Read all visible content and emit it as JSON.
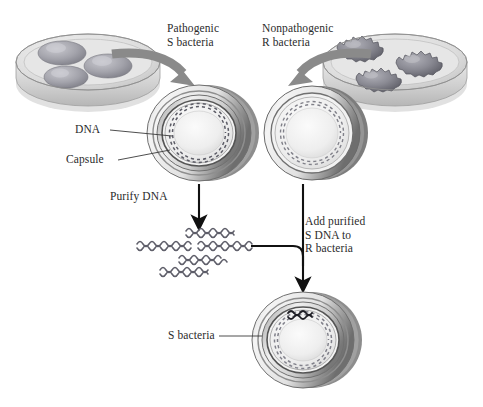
{
  "figure": {
    "background_color": "#ffffff",
    "text_color": "#2b2b2b",
    "arrow_gray": "#8a8a8a",
    "arrow_black": "#111111",
    "dna_color": "#6f6f78"
  },
  "labels": {
    "pathogenic_s": "Pathogenic\nS bacteria",
    "nonpathogenic_r": "Nonpathogenic\nR bacteria",
    "dna": "DNA",
    "capsule": "Capsule",
    "purify_dna": "Purify DNA",
    "add_purified": "Add purified\nS DNA to\nR bacteria",
    "s_bacteria_result": "S bacteria"
  },
  "elements": {
    "petri_dish_left": {
      "name": "petri-dish-smooth-colonies",
      "colony_count": 3,
      "colony_type": "smooth"
    },
    "petri_dish_right": {
      "name": "petri-dish-rough-colonies",
      "colony_count": 3,
      "colony_type": "rough"
    },
    "s_cell": {
      "name": "s-bacterium-with-capsule",
      "has_capsule": true
    },
    "r_cell": {
      "name": "r-bacterium-no-capsule",
      "has_capsule": false
    },
    "transformed_cell": {
      "name": "transformed-s-bacterium",
      "has_capsule": true,
      "has_inserted_dna": true
    },
    "dna_fragments": {
      "name": "purified-dna-fragments",
      "fragment_count": 5
    }
  }
}
